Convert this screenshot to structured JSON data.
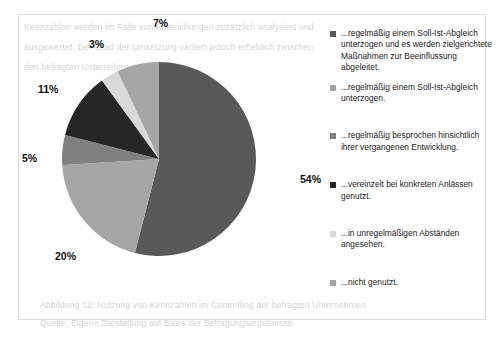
{
  "chart_data": {
    "type": "pie",
    "title": "",
    "subtitle": "",
    "xlabel": "",
    "ylabel": "",
    "grid": false,
    "legend_position": "right",
    "start_angle_deg": 0,
    "direction": "clockwise",
    "categories": [
      "...regelmäßig einem Soll-Ist-Abgleich unterzogen und es werden zielgerichtete Maßnahmen zur Beeinflussung abgeleitet.",
      "...regelmäßig einem Soll-Ist-Abgleich unterzogen.",
      "...regelmäßig besprochen hinsichtlich ihrer vergangenen Entwicklung.",
      "...vereinzelt bei konkreten Anlässen genutzt.",
      "...in unregelmäßigen Abständen angesehen.",
      "...nicht genutzt."
    ],
    "values": [
      54,
      20,
      5,
      11,
      3,
      7
    ],
    "value_labels": [
      "54%",
      "20%",
      "5%",
      "11%",
      "3%",
      "7%"
    ],
    "colors": [
      "#595959",
      "#a6a6a6",
      "#808080",
      "#262626",
      "#d9d9d9",
      "#a6a6a6"
    ],
    "units": "percent",
    "total": 100
  },
  "pie": {
    "center_x": 98,
    "center_y": 98,
    "radius": 97,
    "slices": [
      {
        "name": "slice-54",
        "percent": 54,
        "label": "54%",
        "color": "#595959",
        "start_deg": 0,
        "end_deg": 194.4
      },
      {
        "name": "slice-20",
        "percent": 20,
        "label": "20%",
        "color": "#a6a6a6",
        "start_deg": 194.4,
        "end_deg": 266.4
      },
      {
        "name": "slice-5",
        "percent": 5,
        "label": "5%",
        "color": "#808080",
        "start_deg": 266.4,
        "end_deg": 284.4
      },
      {
        "name": "slice-11",
        "percent": 11,
        "label": "11%",
        "color": "#262626",
        "start_deg": 284.4,
        "end_deg": 324.0
      },
      {
        "name": "slice-3",
        "percent": 3,
        "label": "3%",
        "color": "#d9d9d9",
        "start_deg": 324.0,
        "end_deg": 334.8
      },
      {
        "name": "slice-7",
        "percent": 7,
        "label": "7%",
        "color": "#a6a6a6",
        "start_deg": 334.8,
        "end_deg": 360.0
      }
    ],
    "labels": [
      {
        "text": "7%",
        "left": 153,
        "top": 17
      },
      {
        "text": "3%",
        "left": 89,
        "top": 38
      },
      {
        "text": "11%",
        "left": 38,
        "top": 83
      },
      {
        "text": "5%",
        "left": 22,
        "top": 152
      },
      {
        "text": "20%",
        "left": 55,
        "top": 250
      },
      {
        "text": "54%",
        "left": 300,
        "top": 173
      }
    ]
  },
  "legend": {
    "items": [
      {
        "swatch": "#595959",
        "label": "...regelmäßig einem Soll-Ist-Abgleich unterzogen und es werden zielgerichtete Maßnahmen zur Beeinflussung abgeleitet.",
        "gap_after": 8
      },
      {
        "swatch": "#a6a6a6",
        "label": "...regelmäßig einem Soll-Ist-Abgleich unterzogen.",
        "gap_after": 26
      },
      {
        "swatch": "#808080",
        "label": "...regelmäßig besprochen hinsichtlich ihrer vergangenen Entwicklung.",
        "gap_after": 26
      },
      {
        "swatch": "#262626",
        "label": "...vereinzelt bei konkreten Anlässen genutzt.",
        "gap_after": 26
      },
      {
        "swatch": "#d9d9d9",
        "label": "...in unregelmäßigen Abständen angesehen.",
        "gap_after": 26
      },
      {
        "swatch": "#a6a6a6",
        "label": "...nicht genutzt.",
        "gap_after": 0
      }
    ]
  },
  "bleed_through": {
    "lines": [
      {
        "text": "Kennzahlen werden im Falle von Abweichungen zusätzlich analysiert und",
        "left": 24,
        "top": 22
      },
      {
        "text": "ausgewertet. Der Grad der Umsetzung variiert jedoch erheblich zwischen",
        "left": 24,
        "top": 42
      },
      {
        "text": "den befragten Unternehmen der Branche.",
        "left": 24,
        "top": 62
      },
      {
        "text": "Abbildung 12: Nutzung von Kennzahlen im Controlling der befragten Unternehmen",
        "left": 40,
        "top": 300
      },
      {
        "text": "Quelle: Eigene Darstellung auf Basis der Befragungsergebnisse",
        "left": 40,
        "top": 318
      }
    ]
  }
}
